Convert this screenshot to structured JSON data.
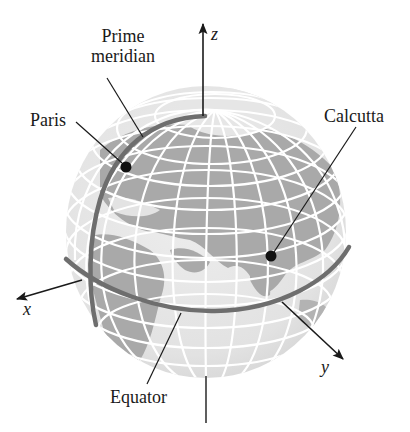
{
  "figure": {
    "labels": {
      "prime_meridian_line1": "Prime",
      "prime_meridian_line2": "meridian",
      "paris": "Paris",
      "calcutta": "Calcutta",
      "equator": "Equator",
      "x_axis": "x",
      "y_axis": "y",
      "z_axis": "z"
    },
    "colors": {
      "background": "#ffffff",
      "ocean": "#e3e3e3",
      "land": "#a9a9a9",
      "grid": "#ffffff",
      "highlight_curves": "#6e6e6e",
      "ink": "#1a1a1a"
    },
    "points": [
      {
        "name": "Paris"
      },
      {
        "name": "Calcutta"
      }
    ]
  }
}
